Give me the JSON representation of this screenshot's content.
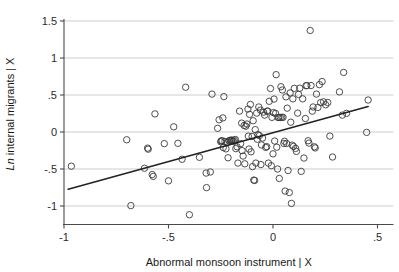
{
  "chart_data": {
    "type": "scatter",
    "title": "",
    "subtitle": "",
    "xlabel": "Abnormal monsoon instrument | X",
    "ylabel": "Ln internal migrants | X",
    "ylabel_italic_prefix": "Ln",
    "ylabel_rest": " internal migrants | X",
    "xlim": [
      -1.0,
      0.5
    ],
    "ylim": [
      -1.25,
      1.55
    ],
    "xticks": [
      -1,
      -0.5,
      0,
      0.5
    ],
    "xtick_labels": [
      "-1",
      "-.5",
      "0",
      ".5"
    ],
    "yticks": [
      -1,
      -0.5,
      0,
      0.5,
      1,
      1.5
    ],
    "ytick_labels": [
      "-1",
      "-.5",
      "0",
      ".5",
      "1",
      "1.5"
    ],
    "grid": "horizontal",
    "grid_color": "#b9b9b9",
    "legend": null,
    "legend_position": "none",
    "marker": "open-circle",
    "marker_color": "#3b3b3b",
    "marker_size": 3.2,
    "fit_line": {
      "label": "linear fit",
      "color": "#222222",
      "x_start": -0.98,
      "y_start": -0.775,
      "x_end": 0.455,
      "y_end": 0.345,
      "slope": 0.781,
      "intercept": -0.011
    },
    "n_points": 150,
    "points": [
      [
        -0.965,
        -0.462
      ],
      [
        -0.7,
        -0.105
      ],
      [
        -0.68,
        -0.995
      ],
      [
        -0.615,
        -0.49
      ],
      [
        -0.6,
        -0.218
      ],
      [
        -0.597,
        -0.232
      ],
      [
        -0.578,
        -0.575
      ],
      [
        -0.573,
        -0.6
      ],
      [
        -0.565,
        0.245
      ],
      [
        -0.52,
        -0.157
      ],
      [
        -0.5,
        -0.66
      ],
      [
        -0.475,
        0.07
      ],
      [
        -0.455,
        -0.153
      ],
      [
        -0.435,
        -0.368
      ],
      [
        -0.418,
        0.605
      ],
      [
        -0.4,
        -1.118
      ],
      [
        -0.352,
        -0.342
      ],
      [
        -0.32,
        -0.555
      ],
      [
        -0.318,
        -0.752
      ],
      [
        -0.3,
        -0.54
      ],
      [
        -0.292,
        0.512
      ],
      [
        -0.265,
        0.05
      ],
      [
        -0.258,
        0.165
      ],
      [
        -0.25,
        -0.132
      ],
      [
        -0.248,
        -0.12
      ],
      [
        -0.243,
        -0.118
      ],
      [
        -0.24,
        0.19
      ],
      [
        -0.238,
        -0.21
      ],
      [
        -0.235,
        0.478
      ],
      [
        -0.23,
        -0.128
      ],
      [
        -0.225,
        -0.228
      ],
      [
        -0.218,
        -0.14
      ],
      [
        -0.215,
        -0.348
      ],
      [
        -0.21,
        -0.118
      ],
      [
        -0.205,
        -0.112
      ],
      [
        -0.2,
        -0.12
      ],
      [
        -0.198,
        -0.108
      ],
      [
        -0.195,
        -0.115
      ],
      [
        -0.19,
        -0.125
      ],
      [
        -0.185,
        -0.11
      ],
      [
        -0.18,
        -0.102
      ],
      [
        -0.178,
        -0.225
      ],
      [
        -0.172,
        -0.2
      ],
      [
        -0.168,
        -0.42
      ],
      [
        -0.16,
        0.282
      ],
      [
        -0.155,
        -0.158
      ],
      [
        -0.15,
        0.12
      ],
      [
        -0.148,
        -0.252
      ],
      [
        -0.143,
        -0.325
      ],
      [
        -0.138,
        0.088
      ],
      [
        -0.135,
        -0.43
      ],
      [
        -0.13,
        0.078
      ],
      [
        -0.125,
        0.108
      ],
      [
        -0.12,
        0.31
      ],
      [
        -0.118,
        -0.055
      ],
      [
        -0.115,
        -0.23
      ],
      [
        -0.112,
        0.238
      ],
      [
        -0.108,
        0.372
      ],
      [
        -0.105,
        -0.268
      ],
      [
        -0.1,
        -0.06
      ],
      [
        -0.098,
        -0.468
      ],
      [
        -0.095,
        0.152
      ],
      [
        -0.092,
        -0.65
      ],
      [
        -0.088,
        -0.655
      ],
      [
        -0.085,
        0.032
      ],
      [
        -0.082,
        -0.42
      ],
      [
        -0.078,
        0.255
      ],
      [
        -0.075,
        -0.098
      ],
      [
        -0.072,
        -0.035
      ],
      [
        -0.068,
        0.338
      ],
      [
        -0.065,
        -0.048
      ],
      [
        -0.06,
        0.295
      ],
      [
        -0.058,
        -0.44
      ],
      [
        -0.055,
        -0.175
      ],
      [
        -0.05,
        -0.082
      ],
      [
        -0.045,
        0.268
      ],
      [
        -0.04,
        0.228
      ],
      [
        -0.035,
        -0.208
      ],
      [
        -0.03,
        -0.198
      ],
      [
        -0.028,
        0.282
      ],
      [
        -0.025,
        0.282
      ],
      [
        -0.022,
        -0.42
      ],
      [
        -0.018,
        0.415
      ],
      [
        -0.012,
        0.588
      ],
      [
        -0.008,
        -0.455
      ],
      [
        -0.005,
        0.198
      ],
      [
        0.0,
        -0.295
      ],
      [
        0.002,
        0.262
      ],
      [
        0.005,
        0.445
      ],
      [
        0.008,
        -0.122
      ],
      [
        0.012,
        0.252
      ],
      [
        0.015,
        0.775
      ],
      [
        0.018,
        -0.205
      ],
      [
        0.022,
        -0.5
      ],
      [
        0.025,
        0.195
      ],
      [
        0.028,
        0.198
      ],
      [
        0.03,
        -0.628
      ],
      [
        0.035,
        0.196
      ],
      [
        0.038,
        0.612
      ],
      [
        0.042,
        0.198
      ],
      [
        0.045,
        0.568
      ],
      [
        0.048,
        0.198
      ],
      [
        0.052,
        -0.155
      ],
      [
        0.055,
        -0.125
      ],
      [
        0.058,
        -0.798
      ],
      [
        0.062,
        0.475
      ],
      [
        0.065,
        -0.155
      ],
      [
        0.068,
        0.322
      ],
      [
        0.072,
        -0.52
      ],
      [
        0.078,
        -0.818
      ],
      [
        0.082,
        0.528
      ],
      [
        0.085,
        0.132
      ],
      [
        0.088,
        -0.965
      ],
      [
        0.092,
        -0.178
      ],
      [
        0.095,
        0.448
      ],
      [
        0.098,
        -0.195
      ],
      [
        0.102,
        0.59
      ],
      [
        0.108,
        -0.222
      ],
      [
        0.112,
        -0.262
      ],
      [
        0.118,
        0.255
      ],
      [
        0.122,
        0.508
      ],
      [
        0.128,
        0.592
      ],
      [
        0.135,
        -0.532
      ],
      [
        0.142,
        0.448
      ],
      [
        0.148,
        -0.352
      ],
      [
        0.155,
        0.182
      ],
      [
        0.158,
        0.625
      ],
      [
        0.162,
        0.628
      ],
      [
        0.168,
        -0.118
      ],
      [
        0.172,
        -0.15
      ],
      [
        0.178,
        1.372
      ],
      [
        0.182,
        0.628
      ],
      [
        0.188,
        0.282
      ],
      [
        0.192,
        0.338
      ],
      [
        0.198,
        -0.2
      ],
      [
        0.202,
        -0.215
      ],
      [
        0.208,
        0.512
      ],
      [
        0.215,
        0.332
      ],
      [
        0.222,
        0.64
      ],
      [
        0.228,
        0.398
      ],
      [
        0.235,
        0.682
      ],
      [
        0.242,
        0.408
      ],
      [
        0.252,
        0.368
      ],
      [
        0.262,
        0.398
      ],
      [
        0.272,
        -0.055
      ],
      [
        0.285,
        -0.338
      ],
      [
        0.318,
        0.542
      ],
      [
        0.332,
        0.228
      ],
      [
        0.338,
        0.805
      ],
      [
        0.352,
        0.252
      ],
      [
        0.448,
        -0.005
      ],
      [
        0.455,
        0.432
      ]
    ]
  }
}
